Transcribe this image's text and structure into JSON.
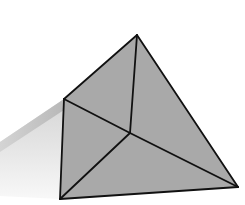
{
  "diagram": {
    "type": "tetrahedron-with-shadow",
    "colors": {
      "background": "#ffffff",
      "face": "#a9a9a9",
      "edge": "#111111",
      "shadow_dark": "#bdbdbd",
      "shadow_light": "#e6e6e6",
      "shadow_fade": "#f7f7f7"
    },
    "vertices": {
      "apex": [
        137,
        35
      ],
      "left": [
        64,
        99
      ],
      "center": [
        130,
        133
      ],
      "bottom_left": [
        60,
        199
      ],
      "bottom_right": [
        238,
        187
      ]
    },
    "edges": [
      [
        "apex",
        "left"
      ],
      [
        "apex",
        "bottom_right"
      ],
      [
        "apex",
        "center"
      ],
      [
        "left",
        "center"
      ],
      [
        "center",
        "bottom_left"
      ],
      [
        "center",
        "bottom_right"
      ],
      [
        "left",
        "bottom_left"
      ],
      [
        "bottom_left",
        "bottom_right"
      ]
    ],
    "faces": [
      [
        "apex",
        "left",
        "center"
      ],
      [
        "apex",
        "center",
        "bottom_right"
      ],
      [
        "left",
        "center",
        "bottom_left"
      ],
      [
        "center",
        "bottom_left",
        "bottom_right"
      ]
    ],
    "shadow": {
      "points": [
        [
          64,
          99
        ],
        [
          0,
          142
        ],
        [
          0,
          196
        ],
        [
          60,
          199
        ]
      ],
      "band_points": [
        [
          64,
          99
        ],
        [
          0,
          142
        ],
        [
          0,
          152
        ],
        [
          64,
          110
        ]
      ]
    }
  }
}
